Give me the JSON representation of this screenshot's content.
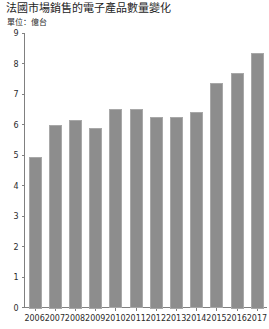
{
  "chart_data": {
    "type": "bar",
    "title": "法國市場銷售的電子產品數量變化",
    "unit_label": "單位：億台",
    "xlabel": "",
    "ylabel": "",
    "ylim": [
      0,
      9
    ],
    "yticks": [
      0,
      1,
      2,
      3,
      4,
      5,
      6,
      7,
      8,
      9
    ],
    "grid": false,
    "legend": "none",
    "categories": [
      "2006",
      "2007",
      "2008",
      "2009",
      "2010",
      "2011",
      "2012",
      "2013",
      "2014",
      "2015",
      "2016",
      "2017"
    ],
    "values": [
      4.95,
      6.0,
      6.15,
      5.9,
      6.5,
      6.5,
      6.25,
      6.25,
      6.4,
      7.35,
      7.7,
      8.35
    ],
    "series": [
      {
        "name": "電子產品數量",
        "values": [
          4.95,
          6.0,
          6.15,
          5.9,
          6.5,
          6.5,
          6.25,
          6.25,
          6.4,
          7.35,
          7.7,
          8.35
        ],
        "color": "#8d8d8d"
      }
    ]
  },
  "colors": {
    "bar_fill": "#8d8d8d",
    "bar_edge": "#a8a8a8",
    "axis": "#808080",
    "text": "#2b2b2b",
    "background": "#ffffff"
  }
}
